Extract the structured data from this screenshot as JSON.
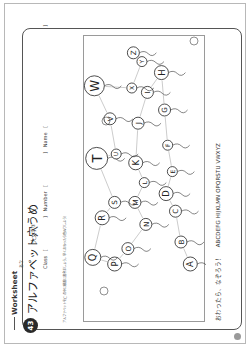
{
  "worksheet": {
    "label": "Worksheet",
    "number": "43",
    "title": "アルファベット穴うめ",
    "ruby": "あな",
    "subtitle": "大文字③",
    "fields": {
      "class_label": "Class",
      "number_label": "Number",
      "name_label": "Name",
      "open_bracket": "[",
      "close_bracket": "]"
    },
    "instruction": "アルファベットを◯の中に順番に書きましょう。早くおわったら色ぬりしよう！",
    "footer_prompt": "おわったら、なぞろう！",
    "footer_alphabet": "ABCDEFG HIJKLMN OPQRSTU VWXYZ",
    "page_marker": "●"
  },
  "diagram": {
    "balloons": [
      {
        "letter": "A",
        "x": 15,
        "y": 100,
        "r": 7
      },
      {
        "letter": "B",
        "x": 27,
        "y": 90,
        "r": 6
      },
      {
        "letter": "C",
        "x": 34,
        "y": 76,
        "r": 6
      },
      {
        "letter": "D",
        "x": 46,
        "y": 68,
        "r": 7
      },
      {
        "letter": "E",
        "x": 38,
        "y": 58,
        "r": 5
      },
      {
        "letter": "F",
        "x": 44,
        "y": 46,
        "r": 5
      },
      {
        "letter": "G",
        "x": 48,
        "y": 30,
        "r": 6
      },
      {
        "letter": "H",
        "x": 52,
        "y": 13,
        "r": 7
      },
      {
        "letter": "I",
        "x": 70,
        "y": 22,
        "r": 6
      },
      {
        "letter": "J",
        "x": 82,
        "y": 36,
        "r": 6
      },
      {
        "letter": "K",
        "x": 85,
        "y": 54,
        "r": 7
      },
      {
        "letter": "L",
        "x": 74,
        "y": 63,
        "r": 5
      },
      {
        "letter": "M",
        "x": 86,
        "y": 72,
        "r": 6
      },
      {
        "letter": "N",
        "x": 72,
        "y": 82,
        "r": 6
      },
      {
        "letter": "O",
        "x": 95,
        "y": 93,
        "r": 6
      },
      {
        "letter": "P",
        "x": 112,
        "y": 100,
        "r": 7
      },
      {
        "letter": "Q",
        "x": 140,
        "y": 97,
        "r": 8
      },
      {
        "letter": "R",
        "x": 128,
        "y": 79,
        "r": 7
      },
      {
        "letter": "S",
        "x": 112,
        "y": 72,
        "r": 6
      },
      {
        "letter": "T",
        "x": 135,
        "y": 52,
        "r": 11
      },
      {
        "letter": "U",
        "x": 110,
        "y": 50,
        "r": 5
      },
      {
        "letter": "V",
        "x": 118,
        "y": 34,
        "r": 6
      },
      {
        "letter": "W",
        "x": 138,
        "y": 19,
        "r": 10
      },
      {
        "letter": "X",
        "x": 90,
        "y": 20,
        "r": 5
      },
      {
        "letter": "Y",
        "x": 77,
        "y": 8,
        "r": 5
      },
      {
        "letter": "Z",
        "x": 88,
        "y": 4,
        "r": 6
      }
    ]
  }
}
